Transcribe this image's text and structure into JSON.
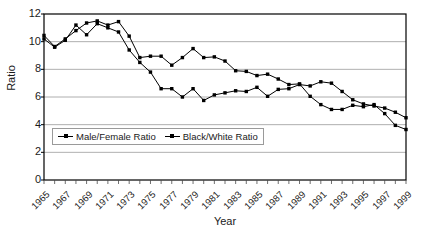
{
  "chart_data": {
    "type": "line",
    "title": "",
    "xlabel": "Year",
    "ylabel": "Ratio",
    "xlim": [
      1965,
      1999
    ],
    "ylim": [
      0,
      12
    ],
    "yticks": [
      0,
      2,
      4,
      6,
      8,
      10,
      12
    ],
    "grid": "horizontal",
    "legend_position": "inside-lower-left",
    "x": [
      1965,
      1966,
      1967,
      1968,
      1969,
      1970,
      1971,
      1972,
      1973,
      1974,
      1975,
      1976,
      1977,
      1978,
      1979,
      1980,
      1981,
      1982,
      1983,
      1984,
      1985,
      1986,
      1987,
      1988,
      1989,
      1990,
      1991,
      1992,
      1993,
      1994,
      1995,
      1996,
      1997,
      1998,
      1999
    ],
    "xtick_labels": [
      "1965",
      "1967",
      "1969",
      "1971",
      "1973",
      "1975",
      "1977",
      "1979",
      "1981",
      "1983",
      "1985",
      "1987",
      "1989",
      "1991",
      "1993",
      "1995",
      "1997",
      "1999"
    ],
    "series": [
      {
        "name": "Male/Female Ratio",
        "marker": "small-dot",
        "color": "#000000",
        "values": [
          10.2,
          9.6,
          10.1,
          11.2,
          10.5,
          11.3,
          11.0,
          10.7,
          9.4,
          8.5,
          7.8,
          6.6,
          6.6,
          6.0,
          6.6,
          5.75,
          6.15,
          6.3,
          6.45,
          6.4,
          6.7,
          6.05,
          6.55,
          6.6,
          6.9,
          6.8,
          7.1,
          7.0,
          6.4,
          5.8,
          5.5,
          5.35,
          5.2,
          4.9,
          4.5
        ]
      },
      {
        "name": "Black/White Ratio",
        "marker": "small-square",
        "color": "#000000",
        "values": [
          10.45,
          9.65,
          10.2,
          10.8,
          11.35,
          11.5,
          11.2,
          11.45,
          10.4,
          8.85,
          8.95,
          8.95,
          8.3,
          8.85,
          9.5,
          8.85,
          8.9,
          8.6,
          7.9,
          7.85,
          7.55,
          7.65,
          7.3,
          6.9,
          6.95,
          6.05,
          5.45,
          5.1,
          5.1,
          5.4,
          5.3,
          5.45,
          4.8,
          3.95,
          3.65
        ]
      }
    ]
  },
  "legend": {
    "items": [
      {
        "label": "Male/Female Ratio"
      },
      {
        "label": "Black/White Ratio"
      }
    ]
  },
  "axes": {
    "y_title": "Ratio",
    "x_title": "Year"
  }
}
